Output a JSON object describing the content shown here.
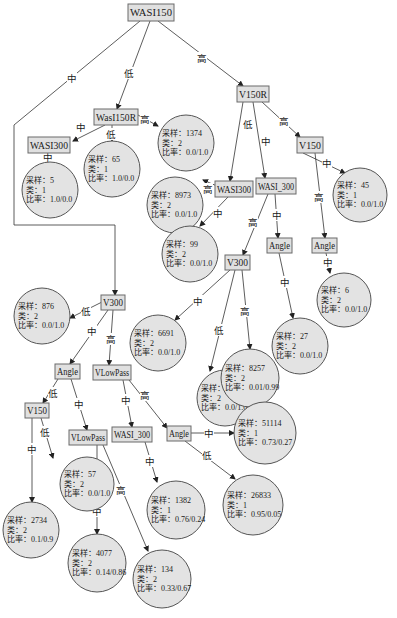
{
  "diagram": {
    "type": "decision-tree",
    "leaf_field_labels": {
      "samples": "采样：",
      "class": "类：",
      "ratio": "比率："
    },
    "branch_labels": {
      "low": "低",
      "mid": "中",
      "high": "高"
    },
    "decision_nodes": [
      {
        "id": "n_root",
        "label": "WASI150",
        "x": 128,
        "y": 4,
        "w": 46,
        "h": 17
      },
      {
        "id": "n_wasi150r",
        "label": "WasI150R",
        "x": 94,
        "y": 109,
        "w": 44,
        "h": 16
      },
      {
        "id": "n_wasi300_a",
        "label": "WASI300",
        "x": 28,
        "y": 137,
        "w": 42,
        "h": 16
      },
      {
        "id": "n_v150r",
        "label": "V150R",
        "x": 237,
        "y": 86,
        "w": 32,
        "h": 16
      },
      {
        "id": "n_v150_a",
        "label": "V150",
        "x": 297,
        "y": 137,
        "w": 26,
        "h": 16
      },
      {
        "id": "n_wasi300_b",
        "label": "WASI300",
        "x": 215,
        "y": 181,
        "w": 38,
        "h": 16
      },
      {
        "id": "n_wasi_300_a",
        "label": "WASI_300",
        "x": 256,
        "y": 178,
        "w": 40,
        "h": 16
      },
      {
        "id": "n_angle_a",
        "label": "Angle",
        "x": 267,
        "y": 238,
        "w": 25,
        "h": 15
      },
      {
        "id": "n_angle_b",
        "label": "Angle",
        "x": 312,
        "y": 238,
        "w": 25,
        "h": 15
      },
      {
        "id": "n_v300_a",
        "label": "V300",
        "x": 225,
        "y": 255,
        "w": 25,
        "h": 15
      },
      {
        "id": "n_v300_b",
        "label": "V300",
        "x": 101,
        "y": 295,
        "w": 24,
        "h": 15
      },
      {
        "id": "n_angle_c",
        "label": "Angle",
        "x": 55,
        "y": 364,
        "w": 25,
        "h": 15
      },
      {
        "id": "n_vlowpass_a",
        "label": "VLowPass",
        "x": 93,
        "y": 365,
        "w": 38,
        "h": 15
      },
      {
        "id": "n_v150_b",
        "label": "V150",
        "x": 25,
        "y": 403,
        "w": 24,
        "h": 15
      },
      {
        "id": "n_vlowpass_b",
        "label": "VLowPass",
        "x": 69,
        "y": 430,
        "w": 38,
        "h": 15
      },
      {
        "id": "n_wasi_300_b",
        "label": "WASI_300",
        "x": 112,
        "y": 427,
        "w": 40,
        "h": 15
      },
      {
        "id": "n_angle_d",
        "label": "Angle",
        "x": 167,
        "y": 426,
        "w": 24,
        "h": 15
      }
    ],
    "leaves": [
      {
        "id": "l1",
        "cx": 186,
        "cy": 143,
        "r": 28,
        "samples": "1374",
        "class": "2",
        "ratio": "0.0/1.0"
      },
      {
        "id": "l2",
        "cx": 112,
        "cy": 169,
        "r": 28,
        "samples": "65",
        "class": "1",
        "ratio": "1.0/0.0"
      },
      {
        "id": "l3",
        "cx": 50,
        "cy": 190,
        "r": 28,
        "samples": "5",
        "class": "1",
        "ratio": "1.0/0.0"
      },
      {
        "id": "l4",
        "cx": 175,
        "cy": 205,
        "r": 28,
        "samples": "8973",
        "class": "2",
        "ratio": "0.0/1.0"
      },
      {
        "id": "l5",
        "cx": 360,
        "cy": 195,
        "r": 27,
        "samples": "45",
        "class": "1",
        "ratio": "0.0/1.0"
      },
      {
        "id": "l6",
        "cx": 190,
        "cy": 254,
        "r": 28,
        "samples": "99",
        "class": "2",
        "ratio": "0.0/1.0"
      },
      {
        "id": "l7",
        "cx": 344,
        "cy": 300,
        "r": 27,
        "samples": "6",
        "class": "2",
        "ratio": "0.0/1.0"
      },
      {
        "id": "l8",
        "cx": 300,
        "cy": 346,
        "r": 28,
        "samples": "27",
        "class": "2",
        "ratio": "0.0/1.0"
      },
      {
        "id": "l9",
        "cx": 42,
        "cy": 316,
        "r": 28,
        "samples": "876",
        "class": "2",
        "ratio": "0.0/1.0"
      },
      {
        "id": "l10",
        "cx": 158,
        "cy": 343,
        "r": 28,
        "samples": "6691",
        "class": "2",
        "ratio": "0.0/1.0"
      },
      {
        "id": "l11",
        "cx": 225,
        "cy": 398,
        "r": 28,
        "samples": "594",
        "class": "2",
        "ratio": "0.0/1.0"
      },
      {
        "id": "l12",
        "cx": 250,
        "cy": 378,
        "r": 29,
        "samples": "8257",
        "class": "2",
        "ratio": "0.01/0.99"
      },
      {
        "id": "l13",
        "cx": 87,
        "cy": 484,
        "r": 27,
        "samples": "57",
        "class": "2",
        "ratio": "0.0/1.0"
      },
      {
        "id": "l14",
        "cx": 265,
        "cy": 433,
        "r": 31,
        "samples": "51114",
        "class": "1",
        "ratio": "0.73/0.27"
      },
      {
        "id": "l15",
        "cx": 253,
        "cy": 505,
        "r": 30,
        "samples": "26833",
        "class": "1",
        "ratio": "0.95/0.05"
      },
      {
        "id": "l16",
        "cx": 176,
        "cy": 510,
        "r": 29,
        "samples": "1382",
        "class": "1",
        "ratio": "0.76/0.24"
      },
      {
        "id": "l17",
        "cx": 31,
        "cy": 530,
        "r": 28,
        "samples": "2734",
        "class": "2",
        "ratio": "0.1/0.9"
      },
      {
        "id": "l18",
        "cx": 97,
        "cy": 563,
        "r": 29,
        "samples": "4077",
        "class": "2",
        "ratio": "0.14/0.86"
      },
      {
        "id": "l19",
        "cx": 162,
        "cy": 579,
        "r": 29,
        "samples": "134",
        "class": "2",
        "ratio": "0.33/0.67"
      }
    ],
    "edges": [
      {
        "points": [
          [
            140,
            21
          ],
          [
            14,
            125
          ],
          [
            14,
            225
          ],
          [
            115,
            225
          ],
          [
            115,
            295
          ]
        ],
        "label": "中",
        "lx": 72,
        "ly": 78
      },
      {
        "points": [
          [
            150,
            21
          ],
          [
            117,
            109
          ]
        ],
        "label": "低",
        "lx": 129,
        "ly": 73
      },
      {
        "points": [
          [
            158,
            21
          ],
          [
            243,
            86
          ]
        ],
        "label": "高",
        "lx": 202,
        "ly": 58
      },
      {
        "points": [
          [
            105,
            125
          ],
          [
            73,
            141
          ]
        ],
        "label": "中",
        "lx": 81,
        "ly": 127
      },
      {
        "points": [
          [
            112,
            125
          ],
          [
            112,
            141
          ]
        ],
        "label": "低",
        "lx": 111,
        "ly": 134
      },
      {
        "points": [
          [
            138,
            115
          ],
          [
            158,
            126
          ]
        ],
        "label": "高",
        "lx": 145,
        "ly": 119
      },
      {
        "points": [
          [
            48,
            153
          ],
          [
            48,
            162
          ]
        ],
        "label": "中",
        "lx": 48,
        "ly": 157
      },
      {
        "points": [
          [
            243,
            102
          ],
          [
            230,
            181
          ]
        ],
        "label": "低",
        "lx": 248,
        "ly": 124
      },
      {
        "points": [
          [
            253,
            102
          ],
          [
            265,
            178
          ]
        ],
        "label": "中",
        "lx": 266,
        "ly": 141
      },
      {
        "points": [
          [
            262,
            102
          ],
          [
            300,
            137
          ]
        ],
        "label": "高",
        "lx": 284,
        "ly": 121
      },
      {
        "points": [
          [
            303,
            153
          ],
          [
            345,
            173
          ]
        ],
        "label": "中",
        "lx": 327,
        "ly": 163
      },
      {
        "points": [
          [
            315,
            153
          ],
          [
            325,
            238
          ]
        ],
        "label": "高",
        "lx": 319,
        "ly": 197
      },
      {
        "points": [
          [
            217,
            186
          ],
          [
            203,
            180
          ]
        ],
        "label": "高",
        "lx": 208,
        "ly": 189
      },
      {
        "points": [
          [
            228,
            197
          ],
          [
            200,
            226
          ]
        ],
        "label": "中",
        "lx": 218,
        "ly": 213
      },
      {
        "points": [
          [
            268,
            194
          ],
          [
            243,
            255
          ]
        ],
        "label": "高",
        "lx": 253,
        "ly": 222
      },
      {
        "points": [
          [
            275,
            194
          ],
          [
            278,
            238
          ]
        ],
        "label": "中",
        "lx": 277,
        "ly": 215
      },
      {
        "points": [
          [
            279,
            253
          ],
          [
            293,
            318
          ]
        ],
        "label": "中",
        "lx": 285,
        "ly": 282
      },
      {
        "points": [
          [
            326,
            253
          ],
          [
            330,
            273
          ]
        ],
        "label": "中",
        "lx": 328,
        "ly": 262
      },
      {
        "points": [
          [
            230,
            270
          ],
          [
            175,
            320
          ]
        ],
        "label": "中",
        "lx": 198,
        "ly": 301
      },
      {
        "points": [
          [
            235,
            270
          ],
          [
            210,
            371
          ]
        ],
        "label": "低",
        "lx": 219,
        "ly": 330
      },
      {
        "points": [
          [
            242,
            270
          ],
          [
            250,
            349
          ]
        ],
        "label": "高",
        "lx": 245,
        "ly": 311
      },
      {
        "points": [
          [
            102,
            302
          ],
          [
            70,
            318
          ]
        ],
        "label": "低",
        "lx": 86,
        "ly": 311
      },
      {
        "points": [
          [
            108,
            310
          ],
          [
            70,
            364
          ]
        ],
        "label": "中",
        "lx": 92,
        "ly": 331
      },
      {
        "points": [
          [
            113,
            310
          ],
          [
            109,
            365
          ]
        ],
        "label": "高",
        "lx": 111,
        "ly": 339
      },
      {
        "points": [
          [
            58,
            379
          ],
          [
            43,
            403
          ]
        ],
        "label": "低",
        "lx": 53,
        "ly": 393
      },
      {
        "points": [
          [
            71,
            379
          ],
          [
            87,
            430
          ]
        ],
        "label": "中",
        "lx": 79,
        "ly": 404
      },
      {
        "points": [
          [
            123,
            380
          ],
          [
            132,
            427
          ]
        ],
        "label": "中",
        "lx": 126,
        "ly": 400
      },
      {
        "points": [
          [
            129,
            380
          ],
          [
            167,
            428
          ]
        ],
        "label": "高",
        "lx": 145,
        "ly": 395
      },
      {
        "points": [
          [
            41,
            418
          ],
          [
            53,
            458
          ]
        ],
        "label": "低",
        "lx": 45,
        "ly": 432
      },
      {
        "points": [
          [
            32,
            418
          ],
          [
            32,
            502
          ]
        ],
        "label": "中",
        "lx": 32,
        "ly": 449
      },
      {
        "points": [
          [
            145,
            442
          ],
          [
            157,
            482
          ]
        ],
        "label": "中",
        "lx": 150,
        "ly": 461
      },
      {
        "points": [
          [
            97,
            445
          ],
          [
            97,
            534
          ]
        ],
        "label": "中",
        "lx": 97,
        "ly": 511
      },
      {
        "points": [
          [
            103,
            445
          ],
          [
            148,
            551
          ]
        ],
        "label": "高",
        "lx": 121,
        "ly": 490
      },
      {
        "points": [
          [
            191,
            433
          ],
          [
            234,
            433
          ]
        ],
        "label": "中",
        "lx": 209,
        "ly": 433
      },
      {
        "points": [
          [
            185,
            441
          ],
          [
            235,
            479
          ]
        ],
        "label": "低",
        "lx": 207,
        "ly": 455
      }
    ]
  }
}
